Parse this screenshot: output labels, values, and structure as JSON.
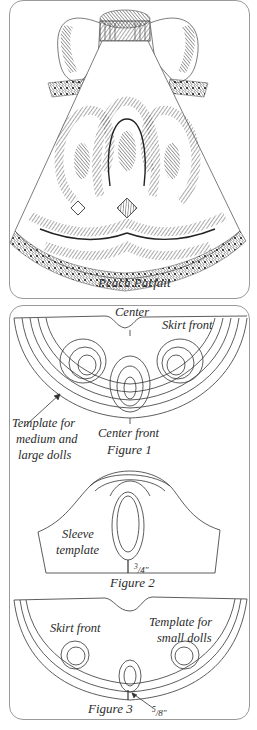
{
  "illustration": {
    "caption": "Peach Parfait",
    "subject": "doll dress with scalloped skirt bands and puff sleeves"
  },
  "figure1": {
    "label_top": "Center",
    "label_skirt": "Skirt front",
    "label_template_l1": "Template for",
    "label_template_l2": "medium and",
    "label_template_l3": "large dolls",
    "label_center_front": "Center front",
    "caption": "Figure 1"
  },
  "figure2": {
    "label_l1": "Sleeve",
    "label_l2": "template",
    "measurement": "3/4\"",
    "measurement_num": "3",
    "measurement_den": "/4\"",
    "caption": "Figure 2"
  },
  "figure3": {
    "label_skirt": "Skirt front",
    "label_template_l1": "Template for",
    "label_template_l2": "small dolls",
    "measurement": "5/8\"",
    "measurement_num": "5",
    "measurement_den": "/8\"",
    "caption": "Figure 3"
  },
  "colors": {
    "ink": "#2a2a2a",
    "border": "#9a9a9a",
    "background": "#ffffff",
    "shade": "#8a8a8a"
  }
}
